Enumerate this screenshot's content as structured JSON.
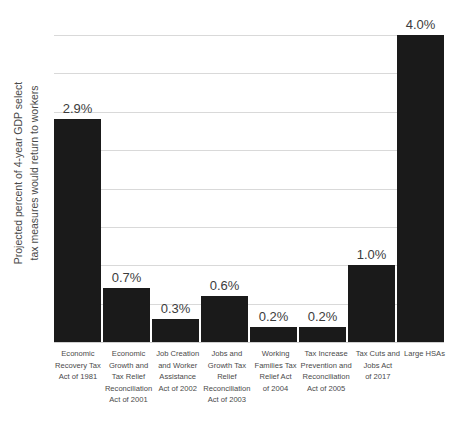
{
  "chart_data": {
    "type": "bar",
    "title": "",
    "xlabel": "",
    "ylabel": "Projected percent of 4-year GDP select tax measures would return to workers",
    "ylabel_lines": [
      "Projected percent of 4-year GDP select",
      "tax measures would return to workers"
    ],
    "ylim": [
      0,
      4.0
    ],
    "y_gridline_values": [
      0,
      0.5,
      1.0,
      1.5,
      2.0,
      2.5,
      3.0,
      3.5,
      4.0
    ],
    "y_tick_labels_shown": false,
    "grid": true,
    "legend": false,
    "bar_color": "#1a1a1a",
    "gridline_color": "#d9d9d9",
    "categories": [
      "Economic Recovery Tax Act of 1981",
      "Economic Growth and Tax Relief Reconciliation Act of 2001",
      "Job Creation and Worker Assistance Act of 2002",
      "Jobs and Growth Tax Relief Reconciliation Act of 2003",
      "Working Families Tax Relief Act of 2004",
      "Tax Increase Prevention and Reconciliation Act of 2005",
      "Tax Cuts and Jobs Act of 2017",
      "Large HSAs"
    ],
    "category_label_lines": [
      [
        "Economic",
        "Recovery Tax",
        "Act of 1981"
      ],
      [
        "Economic",
        "Growth and",
        "Tax Relief",
        "Reconciliation",
        "Act of 2001"
      ],
      [
        "Job Creation",
        "and Worker",
        "Assistance",
        "Act of 2002"
      ],
      [
        "Jobs and",
        "Growth Tax",
        "Relief",
        "Reconciliation",
        "Act of 2003"
      ],
      [
        "Working",
        "Families Tax",
        "Relief Act",
        "of 2004"
      ],
      [
        "Tax Increase",
        "Prevention and",
        "Reconciliation",
        "Act of 2005"
      ],
      [
        "Tax Cuts and",
        "Jobs Act",
        "of 2017"
      ],
      [
        "Large HSAs"
      ]
    ],
    "values": [
      2.9,
      0.7,
      0.3,
      0.6,
      0.2,
      0.2,
      1.0,
      4.0
    ],
    "value_labels": [
      "2.9%",
      "0.7%",
      "0.3%",
      "0.6%",
      "0.2%",
      "0.2%",
      "1.0%",
      "4.0%"
    ]
  }
}
